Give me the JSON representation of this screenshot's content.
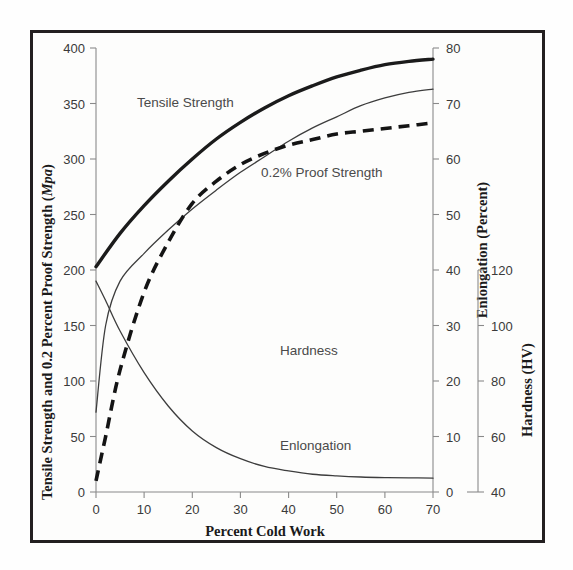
{
  "chart_data": {
    "type": "line",
    "title": "",
    "xlabel": "Percent Cold Work",
    "xlim": [
      0,
      70
    ],
    "xticks": [
      0,
      10,
      20,
      30,
      40,
      50,
      60,
      70
    ],
    "grid": false,
    "legend_position": "inline-annotations",
    "axes": [
      {
        "id": "left",
        "label_parts": [
          "Tensile Strength and 0.2 Percent Proof Strength (",
          "Mpa",
          ")"
        ],
        "label": "Tensile Strength and 0.2 Percent Proof Strength (Mpa)",
        "ylim": [
          0,
          400
        ],
        "yticks": [
          0,
          50,
          100,
          150,
          200,
          250,
          300,
          350,
          400
        ]
      },
      {
        "id": "right-elongation",
        "label": "Enlongation (Percent)",
        "ylim": [
          0,
          80
        ],
        "yticks": [
          0,
          10,
          20,
          30,
          40,
          50,
          60,
          70,
          80
        ]
      },
      {
        "id": "right-hardness",
        "label": "Hardness (HV)",
        "ylim": [
          40,
          120
        ],
        "yticks": [
          40,
          60,
          80,
          100,
          120
        ]
      }
    ],
    "series": [
      {
        "name": "Tensile Strength",
        "axis": "left",
        "style": "solid-thick",
        "unit": "MPa",
        "x": [
          0,
          5,
          10,
          15,
          20,
          25,
          30,
          35,
          40,
          45,
          50,
          55,
          60,
          65,
          70
        ],
        "values": [
          203,
          233,
          258,
          280,
          300,
          318,
          333,
          346,
          357,
          366,
          374,
          380,
          385,
          388,
          390
        ]
      },
      {
        "name": "0.2% Proof Strength",
        "axis": "left",
        "style": "solid-thin",
        "unit": "MPa",
        "x": [
          0,
          2,
          5,
          10,
          15,
          20,
          25,
          30,
          35,
          40,
          45,
          50,
          55,
          60,
          65,
          70
        ],
        "values": [
          72,
          150,
          190,
          215,
          236,
          255,
          272,
          288,
          302,
          316,
          328,
          338,
          348,
          355,
          360,
          363
        ]
      },
      {
        "name": "Hardness",
        "axis": "right-hardness",
        "style": "dashed",
        "unit": "HV",
        "x": [
          0,
          2,
          5,
          10,
          15,
          20,
          25,
          30,
          35,
          40,
          45,
          50,
          55,
          60,
          65,
          70
        ],
        "values": [
          42,
          50,
          62,
          76,
          85,
          92,
          96,
          99,
          101,
          102.5,
          103.5,
          104.5,
          105,
          105.5,
          106,
          106.5
        ]
      },
      {
        "name": "Enlongation",
        "axis": "right-elongation",
        "style": "solid-thin",
        "unit": "Percent",
        "x": [
          0,
          2,
          5,
          10,
          15,
          20,
          25,
          30,
          35,
          40,
          45,
          50,
          55,
          60,
          65,
          70
        ],
        "values": [
          38,
          34.5,
          29,
          21.5,
          15.5,
          11,
          8,
          6,
          4.6,
          3.8,
          3.2,
          2.9,
          2.7,
          2.6,
          2.55,
          2.5
        ]
      }
    ],
    "annotations": [
      {
        "text": "Tensile Strength",
        "x": 6,
        "y": 352,
        "axis": "left"
      },
      {
        "text": "0.2% Proof Strength",
        "x": 34,
        "y": 272,
        "axis": "left"
      },
      {
        "text": "Hardness",
        "x": 38,
        "y": 100,
        "axis": "left"
      },
      {
        "text": "Enlongation",
        "x": 38,
        "y": 48,
        "axis": "left"
      }
    ]
  },
  "ticks": {
    "left": [
      "400",
      "350",
      "300",
      "250",
      "200",
      "150",
      "100",
      "50",
      "0"
    ],
    "bottom": [
      "0",
      "10",
      "20",
      "30",
      "40",
      "50",
      "60",
      "70"
    ],
    "elongation": [
      "80",
      "70",
      "60",
      "50",
      "40",
      "30",
      "20",
      "10",
      "0"
    ],
    "hardness": [
      "120",
      "100",
      "80",
      "60",
      "40"
    ]
  },
  "labels": {
    "y_axis_main_a": "Tensile Strength and 0.2 Percent Proof Strength (",
    "y_axis_main_b": "Mpa",
    "y_axis_main_c": ")",
    "x_axis": "Percent Cold Work",
    "y_axis_elongation": "Enlongation (Percent)",
    "y_axis_hardness": "Hardness (HV)",
    "series_tensile": "Tensile Strength",
    "series_proof": "0.2% Proof Strength",
    "series_hardness": "Hardness",
    "series_elongation": "Enlongation"
  },
  "colors": {
    "background": "#fdfdfc",
    "border": "#231f20",
    "axis": "#8a8a8a",
    "curve_thick": "#1b1b1b",
    "curve_thin": "#3d3d3d",
    "curve_dashed": "#141414",
    "tick_text": "#3a3a3a",
    "title_text": "#1a1a1a"
  }
}
